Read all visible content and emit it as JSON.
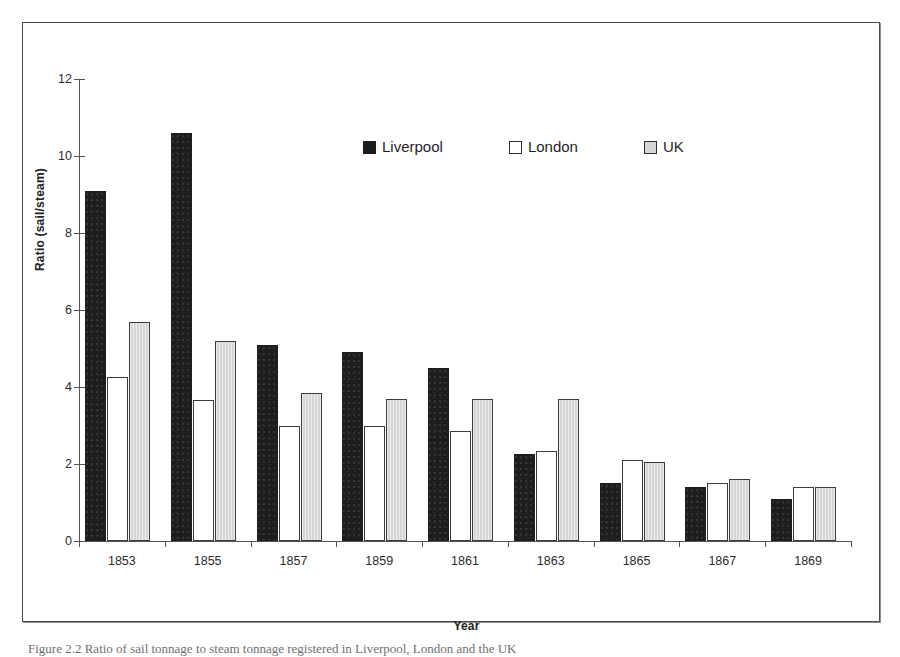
{
  "chart_data": {
    "type": "bar",
    "title": "",
    "xlabel": "Year",
    "ylabel": "Ratio (sail/steam)",
    "categories": [
      "1853",
      "1855",
      "1857",
      "1859",
      "1861",
      "1863",
      "1865",
      "1867",
      "1869"
    ],
    "series": [
      {
        "name": "Liverpool",
        "color": "#1d1d1d",
        "values": [
          9.1,
          10.6,
          5.1,
          4.9,
          4.5,
          2.25,
          1.5,
          1.4,
          1.1
        ]
      },
      {
        "name": "London",
        "color": "#ffffff",
        "values": [
          4.25,
          3.65,
          3.0,
          3.0,
          2.85,
          2.35,
          2.1,
          1.5,
          1.4
        ]
      },
      {
        "name": "UK",
        "color": "#d6d6d6",
        "values": [
          5.7,
          5.2,
          3.85,
          3.7,
          3.7,
          3.7,
          2.05,
          1.6,
          1.4
        ]
      }
    ],
    "ylim": [
      0,
      12
    ],
    "ytick_labels": [
      "0",
      "2",
      "4",
      "6",
      "8",
      "10",
      "12"
    ],
    "ytick_values": [
      0,
      2,
      4,
      6,
      8,
      10,
      12
    ],
    "grid": false,
    "legend_position": "top-center"
  },
  "legend": {
    "items": [
      {
        "label": "Liverpool",
        "swatch": "filled-black-square-icon"
      },
      {
        "label": "London",
        "swatch": "outline-white-square-icon"
      },
      {
        "label": "UK",
        "swatch": "filled-gray-square-icon"
      }
    ]
  },
  "axes": {
    "y_title": "Ratio (sail/steam)",
    "x_title": "Year"
  },
  "caption": {
    "text": "Figure 2.2 Ratio of sail tonnage to steam tonnage registered in Liverpool, London and the UK"
  }
}
